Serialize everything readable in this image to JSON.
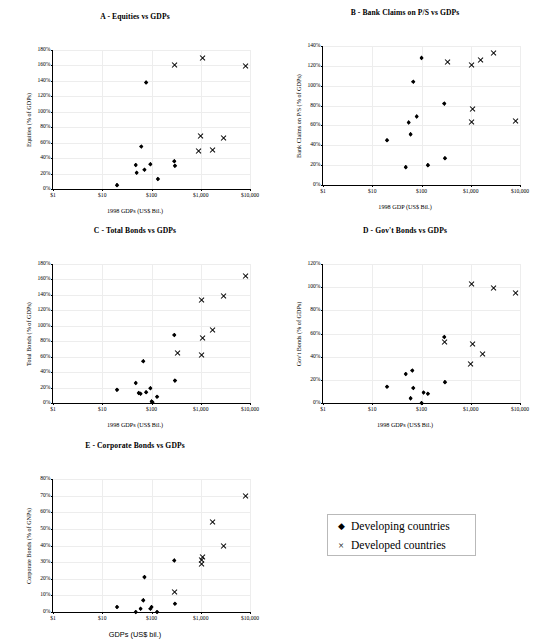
{
  "figure": {
    "legend": {
      "entries": [
        {
          "marker": "diamond-marker",
          "symbol": "◆",
          "label": "Developing countries"
        },
        {
          "marker": "x-marker",
          "symbol": "×",
          "label": "Developed countries"
        }
      ]
    }
  },
  "chart_data": [
    {
      "id": "A",
      "type": "scatter",
      "title": "A - Equities vs GDPs",
      "xlabel": "1998 GDPs (US$ Bil.)",
      "ylabel": "Equities (% of GDPs)",
      "xscale": "log",
      "xlim": [
        1,
        10000
      ],
      "xticks": [
        "$1",
        "$10",
        "$100",
        "$1,000",
        "$10,000"
      ],
      "xtickvalues": [
        1,
        10,
        100,
        1000,
        10000
      ],
      "ylim": [
        0,
        180
      ],
      "yticks": [
        "0%",
        "20%",
        "40%",
        "60%",
        "80%",
        "100%",
        "120%",
        "140%",
        "160%",
        "180%"
      ],
      "ytickvalues": [
        0,
        20,
        40,
        60,
        80,
        100,
        120,
        140,
        160,
        180
      ],
      "series": [
        {
          "name": "Developing countries",
          "marker": "diamond",
          "points": [
            [
              20,
              5
            ],
            [
              48,
              31
            ],
            [
              50,
              21
            ],
            [
              62,
              55
            ],
            [
              72,
              25
            ],
            [
              78,
              138
            ],
            [
              95,
              32
            ],
            [
              135,
              13
            ],
            [
              290,
              36
            ],
            [
              300,
              30
            ]
          ]
        },
        {
          "name": "Developed countries",
          "marker": "x",
          "points": [
            [
              300,
              160
            ],
            [
              1100,
              170
            ],
            [
              1000,
              68
            ],
            [
              900,
              49
            ],
            [
              1700,
              50
            ],
            [
              2900,
              66
            ],
            [
              8200,
              159
            ]
          ]
        }
      ]
    },
    {
      "id": "B",
      "type": "scatter",
      "title": "B - Bank Claims on P/S vs GDPs",
      "xlabel": "1998 GDP (US$ Bil.)",
      "ylabel": "Bank Claims on P/S (% of GDPs)",
      "xscale": "log",
      "xlim": [
        1,
        10000
      ],
      "xticks": [
        "$1",
        "$10",
        "$100",
        "$1,000",
        "$10,000"
      ],
      "xtickvalues": [
        1,
        10,
        100,
        1000,
        10000
      ],
      "ylim": [
        0,
        140
      ],
      "yticks": [
        "0%",
        "20%",
        "40%",
        "60%",
        "80%",
        "100%",
        "120%",
        "140%"
      ],
      "ytickvalues": [
        0,
        20,
        40,
        60,
        80,
        100,
        120,
        140
      ],
      "series": [
        {
          "name": "Developing countries",
          "marker": "diamond",
          "points": [
            [
              20,
              45
            ],
            [
              48,
              18
            ],
            [
              55,
              63
            ],
            [
              60,
              51
            ],
            [
              68,
              104
            ],
            [
              80,
              69
            ],
            [
              100,
              128
            ],
            [
              135,
              20
            ],
            [
              290,
              82
            ],
            [
              300,
              27
            ]
          ]
        },
        {
          "name": "Developed countries",
          "marker": "x",
          "points": [
            [
              330,
              124
            ],
            [
              1050,
              121
            ],
            [
              1100,
              77
            ],
            [
              1050,
              63
            ],
            [
              1600,
              126
            ],
            [
              2900,
              133
            ],
            [
              8200,
              64
            ]
          ]
        }
      ]
    },
    {
      "id": "C",
      "type": "scatter",
      "title": "C - Total Bonds vs GDPs",
      "xlabel": "1998 GDPs (US$ Bil.)",
      "ylabel": "Total Bonds (% of GDPs)",
      "xscale": "log",
      "xlim": [
        1,
        10000
      ],
      "xticks": [
        "$1",
        "$10",
        "$100",
        "$1,000",
        "$10,000"
      ],
      "xtickvalues": [
        1,
        10,
        100,
        1000,
        10000
      ],
      "ylim": [
        0,
        180
      ],
      "yticks": [
        "0%",
        "20%",
        "40%",
        "60%",
        "80%",
        "100%",
        "120%",
        "140%",
        "160%",
        "180%"
      ],
      "ytickvalues": [
        0,
        20,
        40,
        60,
        80,
        100,
        120,
        140,
        160,
        180
      ],
      "series": [
        {
          "name": "Developing countries",
          "marker": "diamond",
          "points": [
            [
              20,
              17
            ],
            [
              48,
              26
            ],
            [
              55,
              13
            ],
            [
              60,
              12
            ],
            [
              68,
              54
            ],
            [
              78,
              14
            ],
            [
              95,
              19
            ],
            [
              100,
              2
            ],
            [
              105,
              1
            ],
            [
              130,
              8
            ],
            [
              290,
              88
            ],
            [
              300,
              29
            ]
          ]
        },
        {
          "name": "Developed countries",
          "marker": "x",
          "points": [
            [
              330,
              65
            ],
            [
              1050,
              134
            ],
            [
              1100,
              84
            ],
            [
              1050,
              62
            ],
            [
              1700,
              95
            ],
            [
              2900,
              139
            ],
            [
              8200,
              164
            ]
          ]
        }
      ]
    },
    {
      "id": "D",
      "type": "scatter",
      "title": "D - Gov't Bonds vs GDPs",
      "xlabel": "1998 GDPs (US$ Bil.)",
      "ylabel": "Gov't Bonds (% of GDPs)",
      "xscale": "log",
      "xlim": [
        1,
        10000
      ],
      "xticks": [
        "$1",
        "$10",
        "$100",
        "$1,000",
        "$10,000"
      ],
      "xtickvalues": [
        1,
        10,
        100,
        1000,
        10000
      ],
      "ylim": [
        0,
        120
      ],
      "yticks": [
        "0%",
        "20%",
        "40%",
        "60%",
        "80%",
        "100%",
        "120%"
      ],
      "ytickvalues": [
        0,
        20,
        40,
        60,
        80,
        100,
        120
      ],
      "series": [
        {
          "name": "Developing countries",
          "marker": "diamond",
          "points": [
            [
              20,
              14
            ],
            [
              48,
              25
            ],
            [
              60,
              4
            ],
            [
              65,
              28
            ],
            [
              68,
              13
            ],
            [
              100,
              0
            ],
            [
              110,
              9
            ],
            [
              135,
              8
            ],
            [
              290,
              57
            ],
            [
              300,
              18
            ]
          ]
        },
        {
          "name": "Developed countries",
          "marker": "x",
          "points": [
            [
              300,
              53
            ],
            [
              1050,
              103
            ],
            [
              1100,
              51
            ],
            [
              1000,
              34
            ],
            [
              1700,
              42
            ],
            [
              2900,
              99
            ],
            [
              8200,
              95
            ]
          ]
        }
      ]
    },
    {
      "id": "E",
      "type": "scatter",
      "title": "E - Corporate Bonds vs GDPs",
      "xlabel": "GDPs (US$ bil.)",
      "ylabel": "Corporate Bonds (% of GNPs)",
      "xscale": "log",
      "xlim": [
        1,
        10000
      ],
      "xticks": [
        "$1",
        "$10",
        "$100",
        "$1,000",
        "$10,000"
      ],
      "xtickvalues": [
        1,
        10,
        100,
        1000,
        10000
      ],
      "ylim": [
        0,
        80
      ],
      "yticks": [
        "0%",
        "10%",
        "20%",
        "30%",
        "40%",
        "50%",
        "60%",
        "70%",
        "80%"
      ],
      "ytickvalues": [
        0,
        10,
        20,
        30,
        40,
        50,
        60,
        70,
        80
      ],
      "series": [
        {
          "name": "Developing countries",
          "marker": "diamond",
          "points": [
            [
              20,
              3
            ],
            [
              48,
              0
            ],
            [
              60,
              2
            ],
            [
              68,
              7
            ],
            [
              72,
              21
            ],
            [
              95,
              2
            ],
            [
              100,
              3
            ],
            [
              130,
              0
            ],
            [
              290,
              31
            ],
            [
              300,
              5
            ]
          ]
        },
        {
          "name": "Developed countries",
          "marker": "x",
          "points": [
            [
              300,
              12
            ],
            [
              1050,
              31
            ],
            [
              1100,
              33
            ],
            [
              1050,
              29
            ],
            [
              1700,
              54
            ],
            [
              2900,
              40
            ],
            [
              8200,
              70
            ]
          ]
        }
      ]
    }
  ]
}
